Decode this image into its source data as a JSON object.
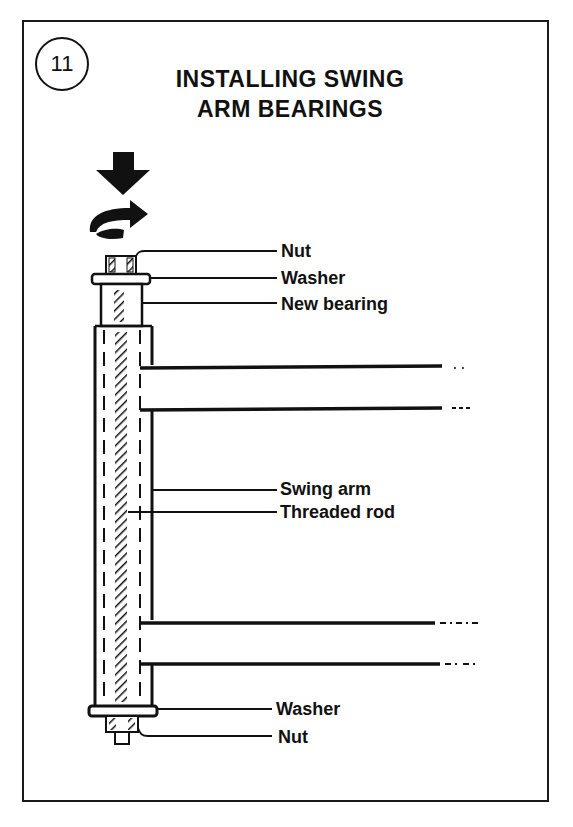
{
  "figure": {
    "step_number": "11",
    "title_line1": "INSTALLING SWING",
    "title_line2": "ARM BEARINGS",
    "icons": [
      "press-down-arrow",
      "rotate-arrow"
    ],
    "labels": {
      "top_nut": "Nut",
      "top_washer": "Washer",
      "new_bearing": "New bearing",
      "swing_arm": "Swing arm",
      "threaded_rod": "Threaded rod",
      "bottom_washer": "Washer",
      "bottom_nut": "Nut"
    },
    "colors": {
      "ink": "#111111",
      "background": "#ffffff"
    }
  }
}
